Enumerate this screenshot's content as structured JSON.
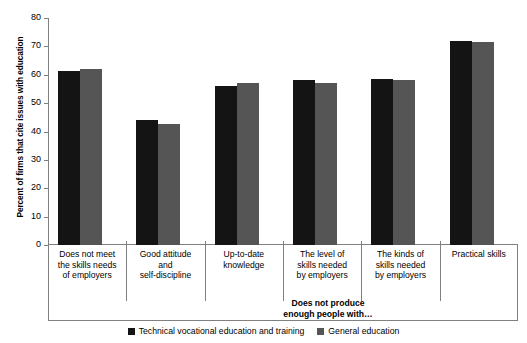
{
  "chart_data": {
    "type": "bar",
    "title": "",
    "xlabel": "",
    "ylabel": "Percent of firms that cite issues with education",
    "ylim": [
      0,
      80
    ],
    "yticks": [
      0,
      10,
      20,
      30,
      40,
      50,
      60,
      70,
      80
    ],
    "ytick_labels": [
      "0",
      "10",
      "20",
      "30",
      "40",
      "50",
      "60",
      "70",
      "80"
    ],
    "grid": false,
    "legend_position": "bottom-center",
    "categories": [
      "Does not meet\nthe skills needs\nof employers",
      "Good attitude\nand\nself-discipline",
      "Up-to-date\nknowledge",
      "The level of\nskills needed\nby employers",
      "The kinds of\nskills needed\nby employers",
      "Practical skills"
    ],
    "category_lines": [
      [
        "Does not meet",
        "the skills needs",
        "of employers"
      ],
      [
        "Good attitude",
        "and",
        "self-discipline"
      ],
      [
        "Up-to-date",
        "knowledge"
      ],
      [
        "The level of",
        "skills needed",
        "by employers"
      ],
      [
        "The kinds of",
        "skills needed",
        "by employers"
      ],
      [
        "Practical skills"
      ]
    ],
    "series": [
      {
        "name": "Technical vocational education and training",
        "color": "#141414",
        "values": [
          61.5,
          44.0,
          56.0,
          58.0,
          58.5,
          72.0
        ]
      },
      {
        "name": "General education",
        "color": "#555555",
        "values": [
          62.0,
          42.5,
          57.0,
          57.0,
          58.0,
          71.5
        ]
      }
    ],
    "annotations": [
      {
        "text": "Does not produce enough people with…",
        "lines": [
          "Does not produce",
          "enough people with…"
        ],
        "spans_categories": [
          3,
          4,
          5
        ]
      }
    ]
  },
  "legend": {
    "items": [
      {
        "label": "Technical vocational education and training",
        "color": "#141414"
      },
      {
        "label": "General education",
        "color": "#555555"
      }
    ]
  },
  "axis": {
    "y_title": "Percent of firms that cite issues with education"
  }
}
